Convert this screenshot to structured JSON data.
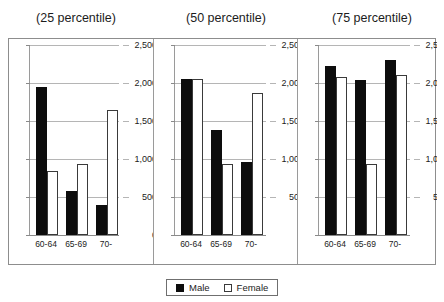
{
  "chart_data": {
    "type": "bar",
    "title": "",
    "xlabel": "",
    "ylabel": "",
    "ylim": [
      0,
      2500
    ],
    "yticks": [
      0,
      500,
      1000,
      1500,
      2000,
      2500
    ],
    "ytick_labels": [
      "0",
      "500",
      "1,000",
      "1,500",
      "2,000",
      "2,500"
    ],
    "grid": true,
    "legend_position": "bottom",
    "categories": [
      "60-64",
      "65-69",
      "70-"
    ],
    "legend": [
      "Male",
      "Female"
    ],
    "panels": [
      {
        "title": "(25 percentile)",
        "series": [
          {
            "name": "Male",
            "values": [
              1950,
              580,
              400
            ]
          },
          {
            "name": "Female",
            "values": [
              840,
              940,
              1650
            ]
          }
        ]
      },
      {
        "title": "(50 percentile)",
        "series": [
          {
            "name": "Male",
            "values": [
              2050,
              1380,
              960
            ]
          },
          {
            "name": "Female",
            "values": [
              2050,
              940,
              1870
            ]
          }
        ]
      },
      {
        "title": "(75 percentile)",
        "series": [
          {
            "name": "Male",
            "values": [
              2230,
              2040,
              2300
            ]
          },
          {
            "name": "Female",
            "values": [
              2080,
              930,
              2110
            ]
          }
        ]
      }
    ],
    "colors": {
      "male": "#0d0d0d",
      "female": "#ffffff",
      "female_border": "#3a3a3a",
      "grid": "#b5b5b5",
      "axis": "#8a8a8a"
    }
  }
}
